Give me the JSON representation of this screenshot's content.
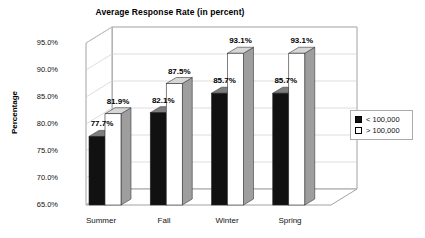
{
  "chart_data": {
    "type": "bar",
    "title": "Average Response Rate (in percent)",
    "xlabel": "",
    "ylabel": "Percentage",
    "categories": [
      "Summer",
      "Fall",
      "Winter",
      "Spring"
    ],
    "series": [
      {
        "name": "< 100,000",
        "values": [
          77.7,
          82.1,
          85.7,
          85.7
        ],
        "value_labels": [
          "77.7%",
          "82.1%",
          "85.7%",
          "85.7%"
        ],
        "color": "#111111"
      },
      {
        "name": "> 100,000",
        "values": [
          81.9,
          87.5,
          93.1,
          93.1
        ],
        "value_labels": [
          "81.9%",
          "87.5%",
          "93.1%",
          "93.1%"
        ],
        "color": "#ffffff"
      }
    ],
    "ylim": [
      65.0,
      95.0
    ],
    "ytick_values": [
      95.0,
      90.0,
      85.0,
      80.0,
      75.0,
      70.0,
      65.0
    ],
    "ytick_labels": [
      "95.0%",
      "90.0%",
      "85.0%",
      "80.0%",
      "75.0%",
      "70.0%",
      "65.0%"
    ],
    "grid": true,
    "legend_position": "right",
    "three_d": true
  },
  "legend": {
    "items": [
      {
        "label": "< 100,000",
        "swatch": "filled"
      },
      {
        "label": "> 100,000",
        "swatch": "empty"
      }
    ]
  },
  "colors": {
    "bar_dark": "#111111",
    "bar_light": "#ffffff",
    "side_dark": "#7d7d7d",
    "side_light": "#9e9e9e",
    "top_light": "#d6d6d6",
    "grid": "#cfcfcf",
    "axis": "#8a8a8a"
  }
}
